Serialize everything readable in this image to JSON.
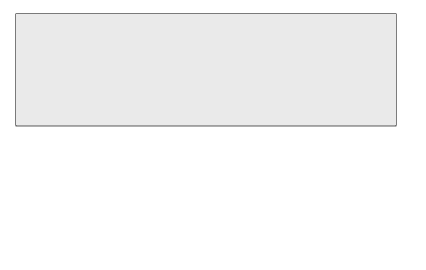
{
  "map": {
    "type": "choropleth",
    "region": "United States",
    "legend": {
      "title": "Percentage of Total Population Comprising African Americans, Hispanics, Asians, Pacific Islanders, and/or Native Americans",
      "classes": [
        {
          "label": "50% or higher",
          "color": "#5a5a5a"
        },
        {
          "label": "40% to 49%",
          "color": "#8a8a8a"
        },
        {
          "label": "30% to 39%",
          "color": "#a8a8a8"
        },
        {
          "label": "20% to 29%",
          "color": "#cfcfcf"
        },
        {
          "label": "10% to 19%",
          "color": "#a4a4a4"
        },
        {
          "label": "9% or lower",
          "color": "#e4e4e4"
        }
      ]
    },
    "state_labels": [
      "WASHINGTON",
      "OREGON",
      "CALIFORNIA",
      "NEVADA",
      "IDAHO",
      "MONTANA",
      "WYOMING",
      "UTAH",
      "ARIZONA",
      "COLORADO",
      "NEW MEXICO",
      "NORTH DAKOTA",
      "SOUTH DAKOTA",
      "NEBRASKA",
      "KANSAS",
      "OKLAHOMA",
      "TEXAS",
      "MINNESOTA",
      "IOWA",
      "MISSOURI",
      "ARKANSAS",
      "LOUISIANA",
      "WISCONSIN",
      "ILLINOIS",
      "MICHIGAN",
      "INDIANA",
      "OHIO",
      "KENTUCKY",
      "TENNESSEE",
      "MISSISSIPPI",
      "ALABAMA",
      "GEORGIA",
      "FLORIDA",
      "SOUTH CAROLINA",
      "NORTH CAROLINA",
      "VIRGINIA",
      "WEST VIRGINIA",
      "PENNSYLVANIA",
      "NEW YORK",
      "NEW JERSEY",
      "DELAWARE",
      "MARYLAND",
      "D.C.",
      "CONNECTICUT",
      "RHODE ISLAND",
      "MASSACHUSETTS",
      "VERMONT",
      "NEW HAMPSHIRE",
      "MAINE",
      "ALASKA",
      "HAWAII"
    ],
    "scale_main": {
      "miles": [
        "0",
        "250",
        "500 Miles"
      ],
      "km": [
        "0",
        "250",
        "500 Kilometers"
      ]
    },
    "scale_alaska": {
      "miles": "300 Miles",
      "km": "0 300 Kilometers"
    },
    "scale_hawaii": {
      "miles": "0 100 Miles",
      "km": "0 100 Kilometers"
    }
  }
}
